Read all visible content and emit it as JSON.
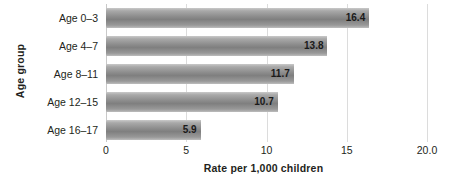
{
  "chart_data": {
    "type": "bar",
    "orientation": "horizontal",
    "title": "",
    "xlabel": "Rate per 1,000 children",
    "ylabel": "Age group",
    "categories": [
      "Age 0–3",
      "Age 4–7",
      "Age 8–11",
      "Age 12–15",
      "Age 16–17"
    ],
    "values": [
      16.4,
      13.8,
      11.7,
      10.7,
      5.9
    ],
    "value_labels": [
      "16.4",
      "13.8",
      "11.7",
      "10.7",
      "5.9"
    ],
    "xlim": [
      0,
      20
    ],
    "xticks": [
      0,
      5,
      10,
      15,
      20
    ],
    "xtick_labels": [
      "0",
      "5",
      "10",
      "15",
      "20.0"
    ],
    "grid": "vertical",
    "legend": "none",
    "bar_color": "#8d8d8d",
    "bar_color_light": "#c9c9c9",
    "gridline_color": "#dcdcdc",
    "text_color": "#231f20"
  }
}
